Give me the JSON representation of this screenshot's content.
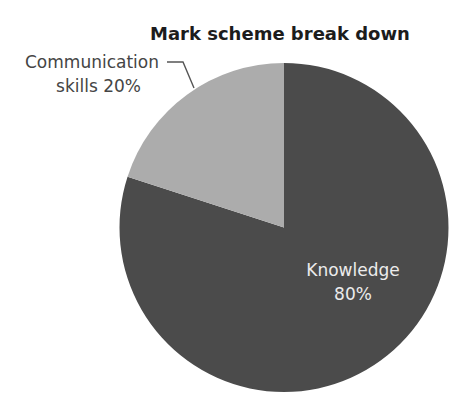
{
  "chart_data": {
    "type": "pie",
    "title": "Mark scheme break down",
    "categories": [
      "Knowledge",
      "Communication skills"
    ],
    "values": [
      80,
      20
    ],
    "unit": "%",
    "labels": [
      {
        "lines": [
          "Knowledge",
          "80%"
        ],
        "position": "inside"
      },
      {
        "lines": [
          "Communication",
          "skills 20%"
        ],
        "position": "outside-left-with-leader-line"
      }
    ],
    "colors": [
      "#4b4b4b",
      "#acacac"
    ],
    "start_angle_deg": 0,
    "direction": "clockwise-from-top for Knowledge",
    "legend": "none"
  },
  "title": "Mark scheme break down",
  "slices": [
    {
      "name": "Knowledge",
      "value": 80,
      "label_line1": "Knowledge",
      "label_line2": "80%",
      "color": "#4b4b4b"
    },
    {
      "name": "Communication skills",
      "value": 20,
      "label_line1": "Communication",
      "label_line2": "skills 20%",
      "color": "#acacac"
    }
  ]
}
